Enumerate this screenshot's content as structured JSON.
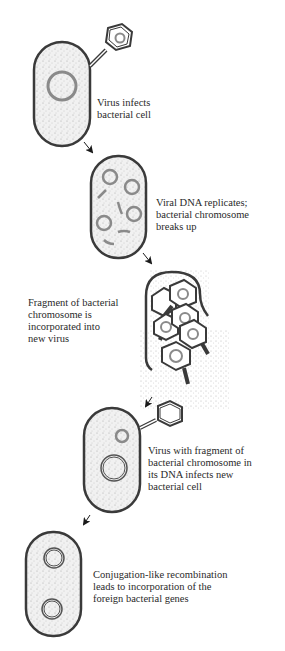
{
  "diagram": {
    "colors": {
      "cell_wall": "#3a3a3a",
      "cytoplasm": "#ededed",
      "chromosome": "#8a8a8a",
      "virus_outline": "#3a3a3a",
      "arrow": "#1a1a1a",
      "text": "#2a2a2a"
    },
    "steps": [
      {
        "id": 1,
        "label_lines": [
          "Virus infects",
          "bacterial cell"
        ]
      },
      {
        "id": 2,
        "label_lines": [
          "Viral DNA replicates;",
          "bacterial chromosome",
          "breaks up"
        ]
      },
      {
        "id": 3,
        "label_lines": [
          "Fragment of bacterial",
          "chromosome is",
          "incorporated into",
          "new virus"
        ]
      },
      {
        "id": 4,
        "label_lines": [
          "Virus with fragment of",
          "bacterial chromosome in",
          "its DNA infects new",
          "bacterial cell"
        ]
      },
      {
        "id": 5,
        "label_lines": [
          "Conjugation-like recombination",
          "leads to incorporation of the",
          "foreign bacterial genes"
        ]
      }
    ],
    "icons": {
      "bacterium": "rounded-capsule",
      "virus": "hexagon-head-with-tail",
      "arrow": "flow-arrow"
    }
  }
}
